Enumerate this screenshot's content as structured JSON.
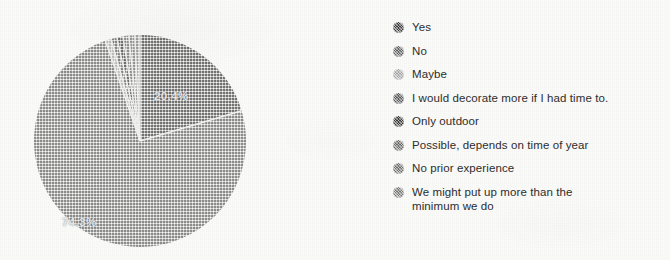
{
  "colors": {
    "page_background": "#fbfbfa",
    "label_text": "#e9e9e9",
    "legend_text": "#2e2e2e",
    "slice_separator": "#f2f2f0"
  },
  "pie": {
    "center_x": 108,
    "center_y": 108,
    "radius": 106,
    "labels": [
      {
        "name": "slice-label-yes",
        "text": "20.4%"
      },
      {
        "name": "slice-label-no",
        "text": "74.3%"
      }
    ]
  },
  "legend": {
    "items": [
      {
        "label": "Yes",
        "label2": "",
        "color": "#3f3f3f"
      },
      {
        "label": "No",
        "label2": "",
        "color": "#636363"
      },
      {
        "label": "Maybe",
        "label2": "",
        "color": "#a8a8a8"
      },
      {
        "label": "I would decorate more if I had time to.",
        "label2": "",
        "color": "#5a5a5a"
      },
      {
        "label": "Only outdoor",
        "label2": "",
        "color": "#3a3a3a"
      },
      {
        "label": "Possible, depends on time of year",
        "label2": "",
        "color": "#6a6a6a"
      },
      {
        "label": "No prior experience",
        "label2": "",
        "color": "#707070"
      },
      {
        "label": "We might put up more than the",
        "label2": "minimum we do",
        "color": "#7a7a7a"
      }
    ]
  },
  "chart_data": {
    "type": "pie",
    "title": "",
    "legend_position": "right",
    "show_labels": true,
    "labels": [
      "Yes",
      "No",
      "Maybe",
      "I would decorate more if I had time to.",
      "Only outdoor",
      "Possible, depends on time of year",
      "No prior experience",
      "We might put up more than the minimum we do"
    ],
    "values": [
      20.4,
      74.3,
      0.9,
      0.9,
      0.9,
      0.9,
      0.9,
      0.8
    ],
    "units": "percent",
    "displayed_value_labels": [
      "20.4%",
      "74.3%"
    ],
    "slice_colors": [
      "#3f3f3f",
      "#636363",
      "#a8a8a8",
      "#5a5a5a",
      "#3a3a3a",
      "#6a6a6a",
      "#707070",
      "#7a7a7a"
    ],
    "start_angle_deg": 0,
    "direction": "clockwise"
  }
}
